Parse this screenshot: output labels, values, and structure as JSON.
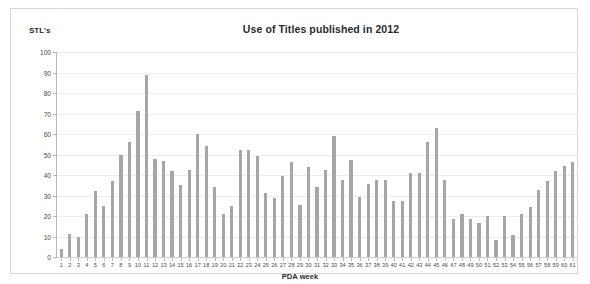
{
  "chart_data": {
    "type": "bar",
    "title": "Use of Titles published in 2012",
    "xlabel": "PDA week",
    "ylabel": "STL's",
    "ylim": [
      0,
      100
    ],
    "ytick_step": 10,
    "yticks": [
      0,
      10,
      20,
      30,
      40,
      50,
      60,
      70,
      80,
      90,
      100
    ],
    "grid": true,
    "legend": false,
    "bar_color": "#a6a6a6",
    "categories": [
      "1",
      "2",
      "3",
      "4",
      "5",
      "6",
      "7",
      "8",
      "9",
      "10",
      "11",
      "12",
      "13",
      "14",
      "15",
      "16",
      "17",
      "18",
      "19",
      "20",
      "21",
      "22",
      "23",
      "24",
      "25",
      "26",
      "27",
      "28",
      "29",
      "30",
      "31",
      "32",
      "33",
      "34",
      "35",
      "36",
      "37",
      "38",
      "39",
      "40",
      "41",
      "42",
      "43",
      "44",
      "45",
      "46",
      "47",
      "48",
      "49",
      "50",
      "51",
      "52",
      "53",
      "54",
      "55",
      "56",
      "57",
      "58",
      "59",
      "60",
      "61"
    ],
    "values": [
      4,
      11,
      10,
      21,
      32,
      25,
      37,
      50,
      56,
      71,
      89,
      48,
      47,
      42,
      35,
      42.5,
      60,
      54,
      34,
      21,
      25,
      52,
      52,
      49.5,
      31,
      29,
      39.5,
      46.5,
      25.5,
      44,
      34,
      42.5,
      59,
      37.5,
      47.5,
      29.5,
      35.5,
      37.5,
      37.5,
      27.5,
      27.5,
      41,
      41,
      56,
      63,
      37.5,
      18.5,
      21,
      18.5,
      16.5,
      20,
      8.5,
      20,
      10.5,
      21,
      24.5,
      32.5,
      37,
      42,
      44.5,
      46.5
    ]
  }
}
